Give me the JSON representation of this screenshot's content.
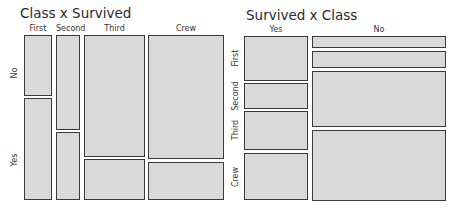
{
  "chart_data": [
    {
      "type": "mosaic",
      "title": "Class x Survived",
      "column_variable": "Class",
      "row_variable": "Survived",
      "columns": [
        "First",
        "Second",
        "Third",
        "Crew"
      ],
      "rows": [
        "No",
        "Yes"
      ],
      "column_widths_px": [
        28,
        24,
        61,
        76
      ],
      "proportions": {
        "First": {
          "No": 0.38,
          "Yes": 0.62
        },
        "Second": {
          "No": 0.58,
          "Yes": 0.42
        },
        "Third": {
          "No": 0.75,
          "Yes": 0.25
        },
        "Crew": {
          "No": 0.76,
          "Yes": 0.24
        }
      },
      "tiles": [
        {
          "col": "First",
          "row": "No",
          "x": 24,
          "y": 35,
          "w": 28,
          "h": 61
        },
        {
          "col": "First",
          "row": "Yes",
          "x": 24,
          "y": 98,
          "w": 28,
          "h": 102
        },
        {
          "col": "Second",
          "row": "No",
          "x": 56,
          "y": 35,
          "w": 24,
          "h": 95
        },
        {
          "col": "Second",
          "row": "Yes",
          "x": 56,
          "y": 132,
          "w": 24,
          "h": 68
        },
        {
          "col": "Third",
          "row": "No",
          "x": 84,
          "y": 35,
          "w": 61,
          "h": 122
        },
        {
          "col": "Third",
          "row": "Yes",
          "x": 84,
          "y": 159,
          "w": 61,
          "h": 41
        },
        {
          "col": "Crew",
          "row": "No",
          "x": 148,
          "y": 35,
          "w": 76,
          "h": 124
        },
        {
          "col": "Crew",
          "row": "Yes",
          "x": 148,
          "y": 162,
          "w": 76,
          "h": 38
        }
      ]
    },
    {
      "type": "mosaic",
      "title": "Survived x Class",
      "column_variable": "Survived",
      "row_variable": "Class",
      "columns": [
        "Yes",
        "No"
      ],
      "rows": [
        "First",
        "Second",
        "Third",
        "Crew"
      ],
      "column_widths_px": [
        64,
        134
      ],
      "proportions": {
        "Yes": {
          "First": 0.28,
          "Second": 0.17,
          "Third": 0.25,
          "Crew": 0.3
        },
        "No": {
          "First": 0.08,
          "Second": 0.11,
          "Third": 0.36,
          "Crew": 0.45
        }
      },
      "tiles": [
        {
          "col": "Yes",
          "row": "First",
          "x": 244,
          "y": 36,
          "w": 64,
          "h": 45
        },
        {
          "col": "Yes",
          "row": "Second",
          "x": 244,
          "y": 83,
          "w": 64,
          "h": 26
        },
        {
          "col": "Yes",
          "row": "Third",
          "x": 244,
          "y": 111,
          "w": 64,
          "h": 39
        },
        {
          "col": "Yes",
          "row": "Crew",
          "x": 244,
          "y": 153,
          "w": 64,
          "h": 47
        },
        {
          "col": "No",
          "row": "First",
          "x": 312,
          "y": 36,
          "w": 134,
          "h": 12
        },
        {
          "col": "No",
          "row": "Second",
          "x": 312,
          "y": 51,
          "w": 134,
          "h": 17
        },
        {
          "col": "No",
          "row": "Third",
          "x": 312,
          "y": 71,
          "w": 134,
          "h": 56
        },
        {
          "col": "No",
          "row": "Crew",
          "x": 312,
          "y": 130,
          "w": 134,
          "h": 71
        }
      ]
    }
  ],
  "left": {
    "title": "Class x Survived",
    "col_labels": [
      {
        "text": "First",
        "x": 24,
        "w": 28
      },
      {
        "text": "Second",
        "x": 56,
        "w": 24
      },
      {
        "text": "Third",
        "x": 84,
        "w": 61
      },
      {
        "text": "Crew",
        "x": 148,
        "w": 76
      }
    ],
    "row_labels": [
      {
        "text": "No",
        "cy": 73
      },
      {
        "text": "Yes",
        "cy": 160
      }
    ]
  },
  "right": {
    "title": "Survived x Class",
    "col_labels": [
      {
        "text": "Yes",
        "x": 244,
        "w": 64
      },
      {
        "text": "No",
        "x": 312,
        "w": 134
      }
    ],
    "row_labels": [
      {
        "text": "First",
        "cy": 58
      },
      {
        "text": "Second",
        "cy": 96
      },
      {
        "text": "Third",
        "cy": 130
      },
      {
        "text": "Crew",
        "cy": 177
      }
    ]
  },
  "style": {
    "tile_fill": "#d9d9d9",
    "tile_border": "#3a3a3a"
  }
}
